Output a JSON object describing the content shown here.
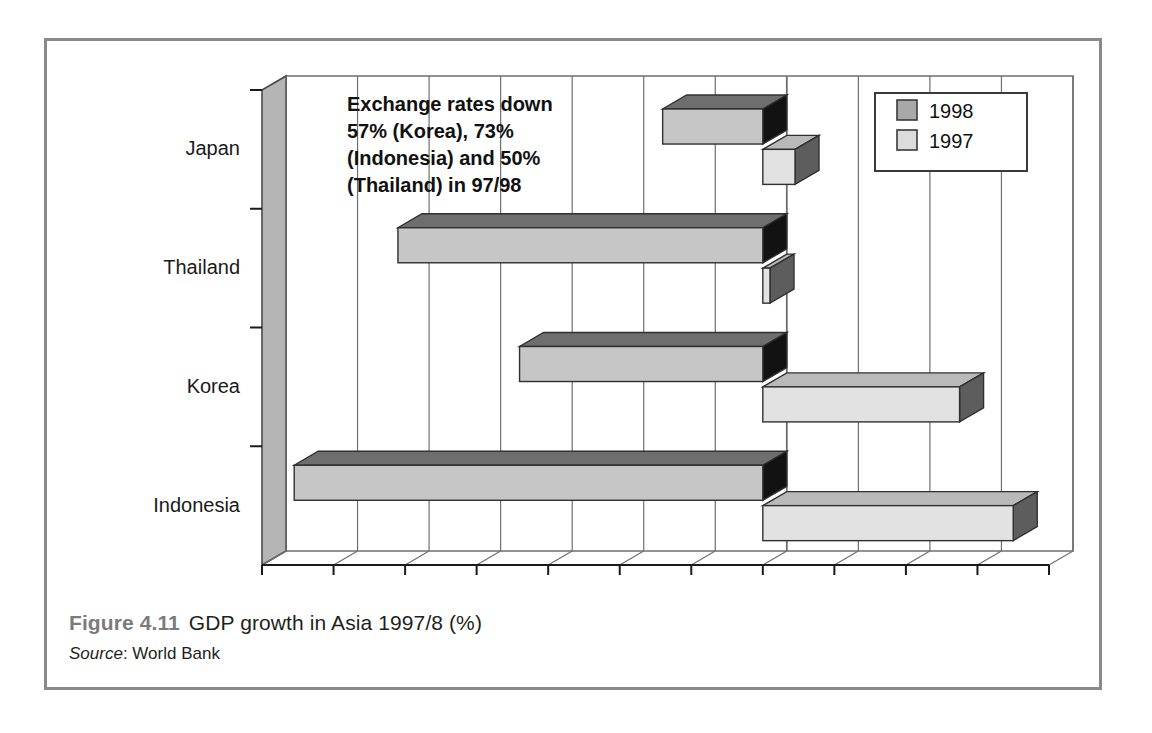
{
  "figure": {
    "number": "Figure 4.11",
    "title": "GDP growth in Asia 1997/8 (%)",
    "source_label": "Source",
    "source_sep": ": ",
    "source_value": "World Bank"
  },
  "annotation": {
    "lines": [
      "Exchange rates down",
      "57% (Korea), 73%",
      "(Indonesia) and 50%",
      "(Thailand) in 97/98"
    ]
  },
  "legend": {
    "position": "top-right",
    "entries": [
      {
        "label": "1998",
        "color": "#a8a8a8"
      },
      {
        "label": "1997",
        "color": "#dcdcdc"
      }
    ]
  },
  "colors": {
    "bar_1998_front": "#c6c6c6",
    "bar_1998_top": "#6e6e6e",
    "bar_1998_side": "#121212",
    "bar_1997_front": "#e2e2e2",
    "bar_1997_top": "#b9b9b9",
    "bar_1997_side": "#5d5d5d",
    "wall": "#b5b5b5",
    "frame": "#8a8a8a",
    "gridline": "#6f6f6f",
    "axis": "#1a1a1a"
  },
  "chart_data": {
    "type": "bar",
    "orientation": "horizontal",
    "title": "GDP growth in Asia 1997/8 (%)",
    "xlabel": "",
    "ylabel": "",
    "categories": [
      "Japan",
      "Thailand",
      "Korea",
      "Indonesia"
    ],
    "series": [
      {
        "name": "1998",
        "values": [
          -2.8,
          -10.2,
          -6.8,
          -13.1
        ]
      },
      {
        "name": "1997",
        "values": [
          0.9,
          0.2,
          5.5,
          7.0
        ]
      }
    ],
    "xlim": [
      -14,
      8
    ],
    "xticks": [
      -14,
      -12,
      -10,
      -8,
      -6,
      -4,
      -2,
      0,
      2,
      4,
      6,
      8
    ],
    "xtick_labels": [
      "−14",
      "−12",
      "−10",
      "−8",
      "−6",
      "−4",
      "−2",
      "0",
      "2",
      "4",
      "6",
      "8"
    ],
    "grid": true,
    "legend_position": "top right",
    "annotations": [
      "Exchange rates down 57% (Korea), 73% (Indonesia) and 50% (Thailand) in 97/98"
    ]
  }
}
